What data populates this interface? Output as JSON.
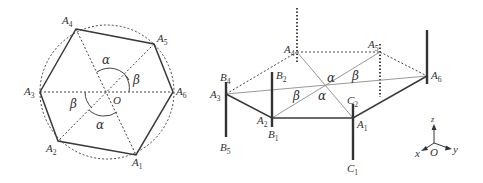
{
  "left_diagram": {
    "center_label": "O",
    "vertices": [
      {
        "name": "A",
        "sub": "1"
      },
      {
        "name": "A",
        "sub": "2"
      },
      {
        "name": "A",
        "sub": "3"
      },
      {
        "name": "A",
        "sub": "4"
      },
      {
        "name": "A",
        "sub": "5"
      },
      {
        "name": "A",
        "sub": "6"
      }
    ],
    "angles": {
      "alpha": "α",
      "beta": "β"
    }
  },
  "right_diagram": {
    "vertices": [
      {
        "name": "A",
        "sub": "1"
      },
      {
        "name": "A",
        "sub": "2"
      },
      {
        "name": "A",
        "sub": "3"
      },
      {
        "name": "A",
        "sub": "4"
      },
      {
        "name": "A",
        "sub": "5"
      },
      {
        "name": "A",
        "sub": "6"
      }
    ],
    "rod_labels": [
      {
        "name": "B",
        "sub": "1"
      },
      {
        "name": "B",
        "sub": "2"
      },
      {
        "name": "B",
        "sub": "4"
      },
      {
        "name": "B",
        "sub": "5"
      },
      {
        "name": "C",
        "sub": "1"
      },
      {
        "name": "C",
        "sub": "2"
      }
    ],
    "angles": {
      "alpha": "α",
      "beta": "β"
    },
    "axes": {
      "x": "x",
      "y": "y",
      "z": "z",
      "origin": "O"
    }
  }
}
